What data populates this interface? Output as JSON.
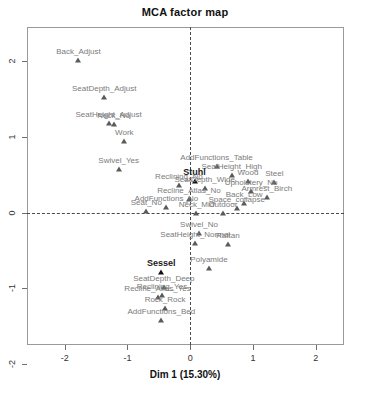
{
  "chart_data": {
    "type": "scatter",
    "title": "MCA factor map",
    "xlabel": "Dim 1 (15.30%)",
    "ylabel": "",
    "xlim": [
      -2.6,
      2.45
    ],
    "ylim": [
      -1.75,
      2.45
    ],
    "xticks": [
      -2,
      -1,
      0,
      1,
      2
    ],
    "xticklabels": [
      "-2",
      "-1",
      "0",
      "1",
      "2"
    ],
    "yticks": [
      2,
      1,
      0,
      -1,
      -2
    ],
    "yticklabels": [
      "2",
      "1",
      "0",
      "-1",
      "-2"
    ],
    "grid": false,
    "legend": null,
    "reference_lines": {
      "vertical_x": 0,
      "horizontal_y": 0,
      "style": "dashed"
    },
    "points": [
      {
        "label": "Back_Adjust",
        "x": -1.78,
        "y": 2.02,
        "emphasis": false
      },
      {
        "label": "SeatDepth_Adjust",
        "x": -1.37,
        "y": 1.52,
        "emphasis": false
      },
      {
        "label": "SeatHeight_Adjust",
        "x": -1.3,
        "y": 1.18,
        "emphasis": false
      },
      {
        "label": "Neck_No",
        "x": -1.22,
        "y": 1.17,
        "emphasis": false
      },
      {
        "label": "Work",
        "x": -1.05,
        "y": 0.94,
        "emphasis": false
      },
      {
        "label": "Swivel_Yes",
        "x": -1.14,
        "y": 0.57,
        "emphasis": false
      },
      {
        "label": "AddFunctions_Table",
        "x": 0.42,
        "y": 0.62,
        "emphasis": false
      },
      {
        "label": "SeatHeight_High",
        "x": 0.66,
        "y": 0.5,
        "emphasis": false
      },
      {
        "label": "Stuhl",
        "x": 0.07,
        "y": 0.42,
        "emphasis": true
      },
      {
        "label": "Wood",
        "x": 0.92,
        "y": 0.41,
        "emphasis": false
      },
      {
        "label": "Steel",
        "x": 1.34,
        "y": 0.4,
        "emphasis": false
      },
      {
        "label": "Reclining_No",
        "x": -0.18,
        "y": 0.36,
        "emphasis": false
      },
      {
        "label": "SeatDepth_Wide",
        "x": 0.23,
        "y": 0.33,
        "emphasis": false
      },
      {
        "label": "Upholstery_No",
        "x": 0.97,
        "y": 0.28,
        "emphasis": false
      },
      {
        "label": "Armrest_Birch",
        "x": 1.22,
        "y": 0.21,
        "emphasis": false
      },
      {
        "label": "Recline_Atlas_No",
        "x": -0.02,
        "y": 0.18,
        "emphasis": false
      },
      {
        "label": "Back_Low",
        "x": 0.86,
        "y": 0.12,
        "emphasis": false
      },
      {
        "label": "AddFunctions_No",
        "x": -0.38,
        "y": 0.07,
        "emphasis": false
      },
      {
        "label": "Space_collapse",
        "x": 0.74,
        "y": 0.06,
        "emphasis": false
      },
      {
        "label": "Seat_No",
        "x": -0.7,
        "y": 0.02,
        "emphasis": false
      },
      {
        "label": "Neck_Mid",
        "x": 0.1,
        "y": 0.0,
        "emphasis": false
      },
      {
        "label": "Outdoor",
        "x": 0.52,
        "y": -0.01,
        "emphasis": false
      },
      {
        "label": "Swivel_No",
        "x": 0.14,
        "y": -0.27,
        "emphasis": false
      },
      {
        "label": "SeatHeight_Normal",
        "x": 0.08,
        "y": -0.4,
        "emphasis": false
      },
      {
        "label": "Rattan",
        "x": 0.6,
        "y": -0.42,
        "emphasis": false
      },
      {
        "label": "Sessel",
        "x": -0.46,
        "y": -0.78,
        "emphasis": true
      },
      {
        "label": "Polyamide",
        "x": 0.3,
        "y": -0.73,
        "emphasis": false
      },
      {
        "label": "SeatDepth_Deep",
        "x": -0.42,
        "y": -0.99,
        "emphasis": false
      },
      {
        "label": "Reclining_Yes",
        "x": -0.45,
        "y": -1.09,
        "emphasis": false
      },
      {
        "label": "Recline_Atlas_Yes",
        "x": -0.52,
        "y": -1.12,
        "emphasis": false
      },
      {
        "label": "Rock_Rock",
        "x": -0.4,
        "y": -1.26,
        "emphasis": false
      },
      {
        "label": "AddFunctions_Bed",
        "x": -0.46,
        "y": -1.42,
        "emphasis": false
      }
    ]
  }
}
